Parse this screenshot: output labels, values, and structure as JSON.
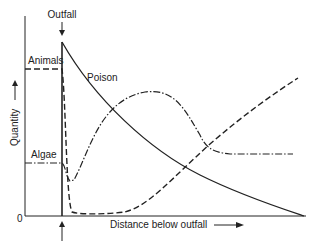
{
  "diagram": {
    "labels": {
      "outfall": "Outfall",
      "animals": "Animals",
      "poison": "Poison",
      "algae": "Algae",
      "y_axis": "Quantity",
      "x_axis": "Distance below outfall",
      "origin": "0"
    },
    "colors": {
      "ink": "#222222",
      "background": "#ffffff"
    },
    "series": [
      {
        "name": "Poison",
        "style": "solid"
      },
      {
        "name": "Animals",
        "style": "dashed"
      },
      {
        "name": "Algae",
        "style": "dash-dot"
      }
    ]
  }
}
